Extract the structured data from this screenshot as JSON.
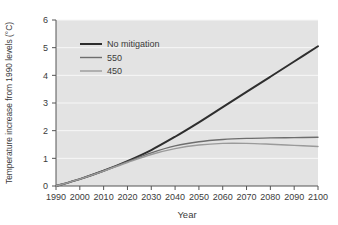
{
  "chart_data": {
    "type": "line",
    "title": "",
    "xlabel": "Year",
    "ylabel": "Temperature increase from 1990 levels (°C)",
    "xlim": [
      1990,
      2100
    ],
    "ylim": [
      0,
      6
    ],
    "xticks": [
      "1990",
      "2000",
      "2010",
      "2020",
      "2030",
      "2040",
      "2050",
      "2060",
      "2070",
      "2080",
      "2090",
      "2100"
    ],
    "yticks": [
      "0",
      "1",
      "2",
      "3",
      "4",
      "5",
      "6"
    ],
    "grid": "horizontal",
    "legend_position": "upper-left-inside",
    "plot_background": "#e3e3e3",
    "gridline_color": "#f7f7f7",
    "axis_color": "#555555",
    "x": [
      1990,
      2000,
      2010,
      2020,
      2030,
      2040,
      2050,
      2060,
      2070,
      2080,
      2090,
      2100
    ],
    "series": [
      {
        "name": "No mitigation",
        "color": "#2e2e2e",
        "width": 2.0,
        "values": [
          0.0,
          0.25,
          0.55,
          0.9,
          1.3,
          1.78,
          2.3,
          2.85,
          3.4,
          3.95,
          4.5,
          5.05
        ]
      },
      {
        "name": "550",
        "color": "#6e6e6e",
        "width": 1.4,
        "values": [
          0.0,
          0.25,
          0.55,
          0.88,
          1.2,
          1.45,
          1.6,
          1.68,
          1.72,
          1.74,
          1.75,
          1.76
        ]
      },
      {
        "name": "450",
        "color": "#9a9a9a",
        "width": 1.4,
        "values": [
          0.0,
          0.25,
          0.54,
          0.85,
          1.14,
          1.35,
          1.48,
          1.54,
          1.54,
          1.51,
          1.47,
          1.43
        ]
      }
    ]
  },
  "legend": {
    "items": [
      {
        "label": "No mitigation"
      },
      {
        "label": "550"
      },
      {
        "label": "450"
      }
    ]
  }
}
